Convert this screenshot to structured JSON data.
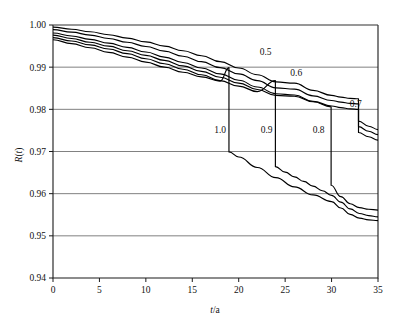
{
  "chart_data": {
    "type": "line",
    "title": "",
    "xlabel": "t/a",
    "ylabel": "R(t)",
    "xlim": [
      0,
      35
    ],
    "ylim": [
      0.94,
      1.0
    ],
    "xticks": [
      "0",
      "5",
      "10",
      "15",
      "20",
      "25",
      "30",
      "35"
    ],
    "xtick_values": [
      0,
      5,
      10,
      15,
      20,
      25,
      30,
      35
    ],
    "yticks": [
      "0.94",
      "0.95",
      "0.96",
      "0.97",
      "0.98",
      "0.99",
      "1.00"
    ],
    "ytick_values": [
      0.94,
      0.95,
      0.96,
      0.97,
      0.98,
      0.99,
      1.0
    ],
    "grid": "horizontal",
    "legend": "inline-curve-labels",
    "line_color": "#000000",
    "background_color": "#ffffff",
    "series": [
      {
        "name": "0.5",
        "label": "0.5",
        "label_x": 22.9,
        "label_y": 0.9928,
        "x": [
          0,
          2,
          4,
          6,
          8,
          10,
          12,
          14,
          16,
          18,
          20,
          22,
          24,
          26,
          28,
          30,
          31,
          32,
          32.9,
          32.9,
          34,
          35
        ],
        "y": [
          0.9995,
          0.999,
          0.9984,
          0.9977,
          0.9969,
          0.996,
          0.995,
          0.9939,
          0.9927,
          0.9913,
          0.9898,
          0.9882,
          0.9865,
          0.9862,
          0.9845,
          0.9833,
          0.9829,
          0.9826,
          0.9825,
          0.9772,
          0.976,
          0.9752
        ]
      },
      {
        "name": "0.6",
        "label": "0.6",
        "label_x": 26.2,
        "label_y": 0.9878,
        "x": [
          0,
          2,
          4,
          6,
          8,
          10,
          12,
          14,
          16,
          18,
          20,
          22,
          24,
          26,
          28,
          30,
          31,
          32,
          32.9,
          32.9,
          34,
          35
        ],
        "y": [
          0.9989,
          0.9983,
          0.9976,
          0.9968,
          0.9959,
          0.9949,
          0.9938,
          0.9926,
          0.9913,
          0.9899,
          0.9884,
          0.9868,
          0.9851,
          0.9848,
          0.9832,
          0.9821,
          0.9817,
          0.9814,
          0.9813,
          0.9759,
          0.9748,
          0.974
        ]
      },
      {
        "name": "0.7",
        "label": "0.7",
        "label_x": 32.6,
        "label_y": 0.9805,
        "x": [
          0,
          2,
          4,
          6,
          8,
          10,
          12,
          14,
          16,
          18,
          20,
          22,
          24,
          26,
          28,
          30,
          31,
          32,
          32.9,
          32.9,
          34,
          35
        ],
        "y": [
          0.9981,
          0.9974,
          0.9966,
          0.9957,
          0.9947,
          0.9936,
          0.9924,
          0.9911,
          0.9898,
          0.9884,
          0.9869,
          0.9853,
          0.9837,
          0.9834,
          0.9819,
          0.9808,
          0.9804,
          0.9801,
          0.98,
          0.9745,
          0.9735,
          0.9727
        ]
      },
      {
        "name": "0.8",
        "label": "0.8",
        "label_x": 28.6,
        "label_y": 0.9745,
        "x": [
          0,
          2,
          4,
          6,
          8,
          10,
          12,
          14,
          16,
          18,
          20,
          22,
          24,
          26,
          28,
          29.95,
          29.95,
          31,
          32,
          33,
          34,
          35
        ],
        "y": [
          0.9976,
          0.9968,
          0.9959,
          0.995,
          0.9939,
          0.9928,
          0.9916,
          0.9903,
          0.989,
          0.9876,
          0.9862,
          0.9847,
          0.9833,
          0.9831,
          0.9818,
          0.9806,
          0.962,
          0.9593,
          0.9576,
          0.9567,
          0.9563,
          0.9561
        ]
      },
      {
        "name": "0.9",
        "label": "0.9",
        "label_x": 23.0,
        "label_y": 0.9745,
        "x": [
          0,
          2,
          4,
          6,
          8,
          10,
          12,
          14,
          16,
          18,
          20,
          22,
          23.95,
          23.95,
          25,
          26,
          27,
          28,
          29,
          30,
          31,
          32,
          33,
          34,
          35
        ],
        "y": [
          0.997,
          0.9962,
          0.9953,
          0.9943,
          0.9932,
          0.992,
          0.9908,
          0.9895,
          0.9882,
          0.9868,
          0.9855,
          0.9842,
          0.9868,
          0.9664,
          0.9651,
          0.964,
          0.9629,
          0.9618,
          0.9607,
          0.9596,
          0.958,
          0.9564,
          0.9553,
          0.9548,
          0.9545
        ]
      },
      {
        "name": "1.0",
        "label": "1.0",
        "label_x": 18.0,
        "label_y": 0.9745,
        "x": [
          0,
          2,
          4,
          6,
          8,
          10,
          12,
          14,
          16,
          18,
          18.95,
          18.95,
          20,
          22,
          24,
          26,
          28,
          30,
          31,
          32,
          33,
          34,
          35
        ],
        "y": [
          0.9965,
          0.9956,
          0.9946,
          0.9935,
          0.9924,
          0.9912,
          0.99,
          0.9888,
          0.9877,
          0.9867,
          0.9899,
          0.9699,
          0.9687,
          0.9662,
          0.9638,
          0.9616,
          0.9597,
          0.9581,
          0.9566,
          0.9551,
          0.9542,
          0.9538,
          0.9536
        ]
      }
    ]
  },
  "plot": {
    "left_px": 53,
    "right_px": 378,
    "top_px": 25,
    "bottom_px": 278
  }
}
